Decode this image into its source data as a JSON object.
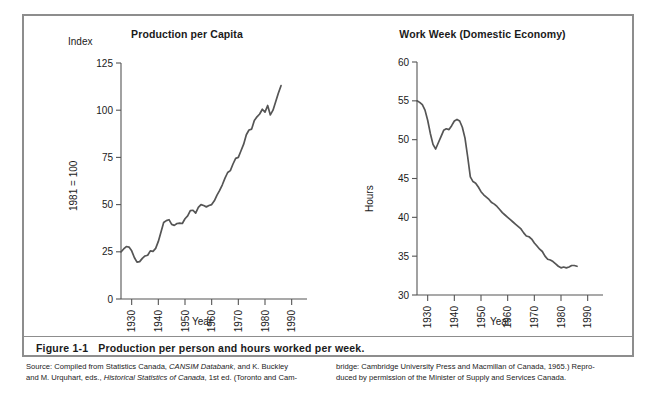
{
  "figure": {
    "caption_number": "Figure 1-1",
    "caption_text": "Production per person and hours worked per week.",
    "source_col1_line1_a": "Source: Compiled from Statistics Canada, ",
    "source_col1_line1_b": "CANSIM Databank",
    "source_col1_line1_c": ", and K. Buckley",
    "source_col1_line2_a": "and M. Urquhart, eds., ",
    "source_col1_line2_b": "Historical Statistics of Canada",
    "source_col1_line2_c": ", 1st ed. (Toronto and Cam-",
    "source_col2_line1": "bridge: Cambridge University Press and Macmillan of Canada, 1965.) Repro-",
    "source_col2_line2": "duced by permission of the Minister of Supply and Services Canada."
  },
  "chart_data": [
    {
      "id": "production-per-capita",
      "type": "line",
      "title": "Production per Capita",
      "xlabel": "Year",
      "ylabel": "1981 = 100",
      "yunit_label": "Index",
      "xlim": [
        1926,
        1992
      ],
      "ylim": [
        0,
        125
      ],
      "xticks": [
        1930,
        1940,
        1950,
        1960,
        1970,
        1980,
        1990
      ],
      "yticks": [
        0,
        25,
        50,
        75,
        100,
        125
      ],
      "grid": false,
      "legend": "none",
      "line_color": "#555555",
      "x": [
        1926,
        1927,
        1928,
        1929,
        1930,
        1931,
        1932,
        1933,
        1934,
        1935,
        1936,
        1937,
        1938,
        1939,
        1940,
        1941,
        1942,
        1943,
        1944,
        1945,
        1946,
        1947,
        1948,
        1949,
        1950,
        1951,
        1952,
        1953,
        1954,
        1955,
        1956,
        1957,
        1958,
        1959,
        1960,
        1961,
        1962,
        1963,
        1964,
        1965,
        1966,
        1967,
        1968,
        1969,
        1970,
        1971,
        1972,
        1973,
        1974,
        1975,
        1976,
        1977,
        1978,
        1979,
        1980,
        1981,
        1982,
        1983,
        1984,
        1985,
        1986
      ],
      "values": [
        25.0,
        26.5,
        27.8,
        27.5,
        25.5,
        22.0,
        19.5,
        19.8,
        21.5,
        22.8,
        23.2,
        25.5,
        25.2,
        26.8,
        30.5,
        35.5,
        40.5,
        41.5,
        42.0,
        39.5,
        39.0,
        40.0,
        40.2,
        40.0,
        42.5,
        44.0,
        46.8,
        47.0,
        45.5,
        48.5,
        50.0,
        49.5,
        48.8,
        49.5,
        50.0,
        52.0,
        55.0,
        57.5,
        60.5,
        64.0,
        67.0,
        68.0,
        71.5,
        74.5,
        75.0,
        78.5,
        82.0,
        87.0,
        89.5,
        90.0,
        94.5,
        96.5,
        98.0,
        100.5,
        99.0,
        102.5,
        97.5,
        100.0,
        104.5,
        109.0,
        113.0
      ]
    },
    {
      "id": "work-week-domestic-economy",
      "type": "line",
      "title": "Work Week (Domestic Economy)",
      "xlabel": "Year",
      "ylabel": "Hours",
      "xlim": [
        1926,
        1992
      ],
      "ylim": [
        30,
        60
      ],
      "xticks": [
        1930,
        1940,
        1950,
        1960,
        1970,
        1980,
        1990
      ],
      "yticks": [
        30,
        35,
        40,
        45,
        50,
        55,
        60
      ],
      "grid": false,
      "legend": "none",
      "line_color": "#555555",
      "x": [
        1926,
        1927,
        1928,
        1929,
        1930,
        1931,
        1932,
        1933,
        1934,
        1935,
        1936,
        1937,
        1938,
        1939,
        1940,
        1941,
        1942,
        1943,
        1944,
        1945,
        1946,
        1947,
        1948,
        1949,
        1950,
        1951,
        1952,
        1953,
        1954,
        1955,
        1956,
        1957,
        1958,
        1959,
        1960,
        1961,
        1962,
        1963,
        1964,
        1965,
        1966,
        1967,
        1968,
        1969,
        1970,
        1971,
        1972,
        1973,
        1974,
        1975,
        1976,
        1977,
        1978,
        1979,
        1980,
        1981,
        1982,
        1983,
        1984,
        1985,
        1986
      ],
      "values": [
        55.0,
        54.8,
        54.5,
        53.8,
        52.5,
        50.8,
        49.4,
        48.8,
        49.6,
        50.4,
        51.2,
        51.4,
        51.3,
        51.8,
        52.4,
        52.6,
        52.4,
        51.6,
        50.2,
        47.8,
        45.2,
        44.6,
        44.4,
        43.9,
        43.3,
        42.9,
        42.6,
        42.3,
        41.9,
        41.7,
        41.4,
        41.0,
        40.6,
        40.3,
        40.0,
        39.7,
        39.4,
        39.1,
        38.8,
        38.5,
        38.0,
        37.6,
        37.5,
        37.2,
        36.7,
        36.3,
        35.9,
        35.6,
        35.0,
        34.6,
        34.5,
        34.3,
        34.0,
        33.7,
        33.5,
        33.6,
        33.5,
        33.6,
        33.8,
        33.8,
        33.7
      ]
    }
  ]
}
